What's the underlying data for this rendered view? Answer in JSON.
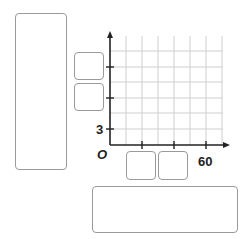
{
  "graph": {
    "origin_label": "O",
    "y_tick_label": "3",
    "x_tick_label": "60",
    "x_label_value": 60,
    "y_label_value": 3
  },
  "answer_boxes": {
    "y_axis_title_box": "",
    "y_axis_box_1": "",
    "y_axis_box_2": "",
    "x_axis_box_1": "",
    "x_axis_box_2": "",
    "graph_title_box": ""
  },
  "colors": {
    "axis": "#222222",
    "grid": "#cfcfcf",
    "box_border": "#9a9a9a"
  }
}
